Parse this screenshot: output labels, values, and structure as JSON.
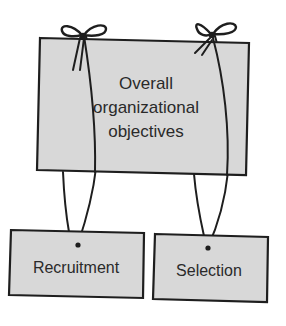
{
  "diagram": {
    "type": "hierarchy",
    "colors": {
      "box_fill": "#d8d8d8",
      "stroke": "#1e1e1e",
      "text": "#2a2a2a",
      "background": "#ffffff"
    },
    "top_box": {
      "lines": [
        "Overall",
        "organizational",
        "objectives"
      ]
    },
    "child_boxes": [
      {
        "label": "Recruitment"
      },
      {
        "label": "Selection"
      }
    ],
    "connections": [
      {
        "from": "Overall organizational objectives",
        "to": "Recruitment",
        "style": "string tied with bow"
      },
      {
        "from": "Overall organizational objectives",
        "to": "Selection",
        "style": "string tied with bow"
      }
    ]
  }
}
